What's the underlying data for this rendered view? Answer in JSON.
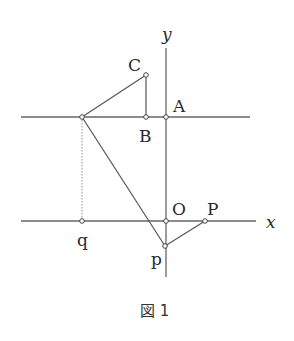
{
  "figure": {
    "caption": "図 1",
    "labels": {
      "y_axis": "y",
      "x_axis": "x",
      "C": "C",
      "A": "A",
      "B": "B",
      "O": "O",
      "P": "P",
      "q": "q",
      "p": "p"
    },
    "points": {
      "C": [
        146,
        75
      ],
      "B": [
        146,
        117
      ],
      "A": [
        166,
        117
      ],
      "left_top": [
        82,
        117
      ],
      "q": [
        82,
        221
      ],
      "O": [
        166,
        221
      ],
      "P": [
        205,
        221
      ],
      "p": [
        165,
        246
      ]
    },
    "colors": {
      "line": "#555555",
      "text": "#2a2a2a"
    }
  }
}
